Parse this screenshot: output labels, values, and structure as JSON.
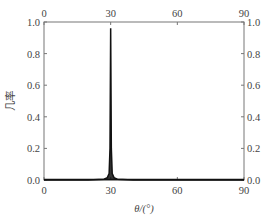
{
  "chart_data": {
    "type": "line",
    "title": "",
    "xlabel": "θ/(°)",
    "ylabel": "几率",
    "xlim": [
      0,
      90
    ],
    "ylim": [
      0.0,
      1.0
    ],
    "grid": false,
    "legend": null,
    "x_ticks": [
      0,
      30,
      60,
      90
    ],
    "x_tick_labels": [
      "0",
      "30",
      "60",
      "90"
    ],
    "y_ticks": [
      0.0,
      0.2,
      0.4,
      0.6,
      0.8,
      1.0
    ],
    "y_tick_labels": [
      "0.0",
      "0.2",
      "0.4",
      "0.6",
      "0.8",
      "1.0"
    ],
    "mirrored_axes": {
      "top_x": true,
      "right_y": true
    },
    "series": [
      {
        "name": "probability",
        "color": "#111111",
        "peak": {
          "x": 30,
          "y": 0.96
        },
        "x": [
          0,
          20,
          27,
          28.5,
          29.3,
          29.7,
          30,
          30.3,
          30.7,
          31.5,
          33,
          40,
          60,
          90
        ],
        "y": [
          0.0,
          0.0,
          0.005,
          0.015,
          0.04,
          0.2,
          0.96,
          0.2,
          0.04,
          0.015,
          0.005,
          0.0,
          0.0,
          0.0
        ]
      }
    ]
  }
}
